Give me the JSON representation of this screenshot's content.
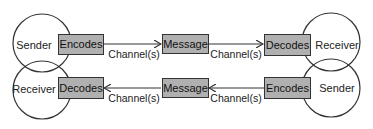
{
  "diagram": {
    "type": "two-way communication model",
    "top_row": {
      "left_node": "Sender",
      "left_box": "Encodes",
      "channel_left": "Channel(s)",
      "middle_box": "Message",
      "channel_right": "Channel(s)",
      "right_box": "Decodes",
      "right_node": "Receiver",
      "direction": "left-to-right"
    },
    "bottom_row": {
      "left_node": "Receiver",
      "left_box": "Decodes",
      "channel_left": "Channel(s)",
      "middle_box": "Message",
      "channel_right": "Channel(s)",
      "right_box": "Encodes",
      "right_node": "Sender",
      "direction": "right-to-left"
    },
    "colors": {
      "box_fill": "#b0b0b0",
      "stroke": "#333333",
      "background": "#ffffff"
    }
  }
}
